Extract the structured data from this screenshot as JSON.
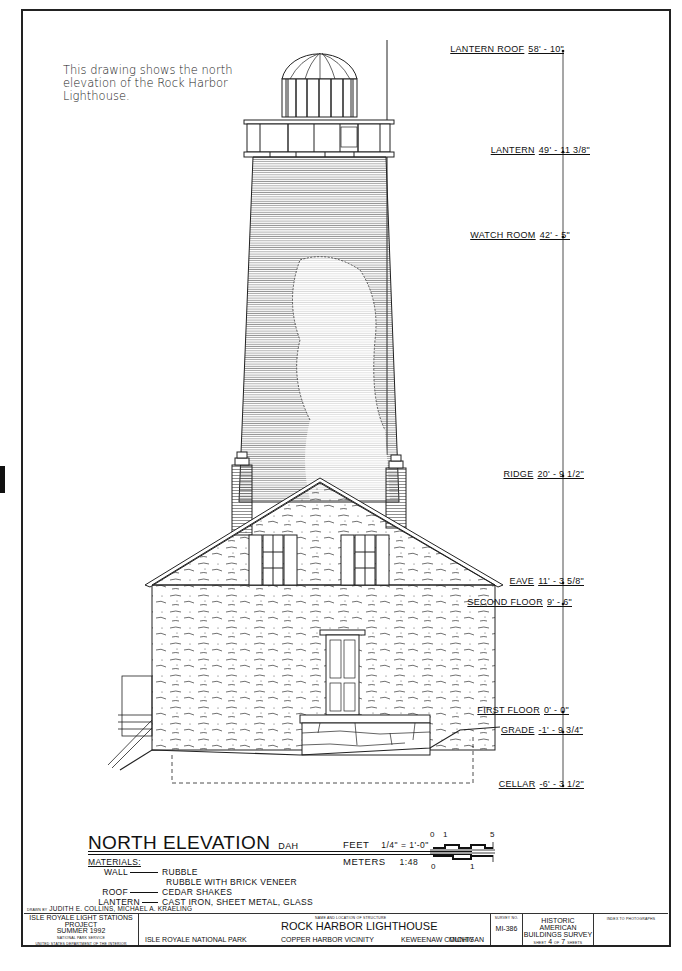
{
  "caption": "This drawing shows the north elevation of the Rock Harbor Lighthouse.",
  "elevations": [
    {
      "name": "LANTERN ROOF",
      "value": "58' - 10\""
    },
    {
      "name": "LANTERN",
      "value": "49' - 11 3/8\""
    },
    {
      "name": "WATCH ROOM",
      "value": "42' - 5\""
    },
    {
      "name": "RIDGE",
      "value": "20' - 9 1/2\""
    },
    {
      "name": "EAVE",
      "value": "11' - 3 5/8\""
    },
    {
      "name": "SECOND FLOOR",
      "value": "9' - 6\""
    },
    {
      "name": "FIRST FLOOR",
      "value": "0' - 0\""
    },
    {
      "name": "GRADE",
      "value": "-1' - 9 3/4\""
    },
    {
      "name": "CELLAR",
      "value": "-6' - 3 1/2\""
    }
  ],
  "title": {
    "main": "NORTH ELEVATION",
    "suffix": "DAH"
  },
  "scale": {
    "feet_label": "FEET",
    "feet_value": "1/4\" = 1'-0\"",
    "meters_label": "METERS",
    "meters_value": "1:48",
    "feet_ticks": [
      "0",
      "1",
      "5"
    ],
    "meter_ticks": [
      "0",
      "1"
    ]
  },
  "materials": {
    "header": "MATERIALS:",
    "rows": [
      {
        "key": "WALL",
        "value": "RUBBLE"
      },
      {
        "key": "",
        "value": "RUBBLE WITH BRICK VENEER"
      },
      {
        "key": "ROOF",
        "value": "CEDAR SHAKES"
      },
      {
        "key": "LANTERN",
        "value": "CAST IRON, SHEET METAL, GLASS"
      }
    ]
  },
  "title_block": {
    "drawn_by_label": "DRAWN BY",
    "drawn_by": "JUDITH E. COLLINS, MICHAEL A. KRAELING",
    "project": "ISLE ROYALE LIGHT STATIONS PROJECT",
    "date": "SUMMER 1992",
    "agency": "NATIONAL PARK SERVICE",
    "department": "UNITED STATES DEPARTMENT OF THE INTERIOR",
    "park": "ISLE ROYALE NATIONAL PARK",
    "structure_label": "NAME AND LOCATION OF STRUCTURE",
    "structure_name": "ROCK HARBOR LIGHTHOUSE",
    "vicinity": "COPPER HARBOR VICINITY",
    "county": "KEWEENAW COUNTY",
    "state": "MICHIGAN",
    "survey_label": "SURVEY NO.",
    "survey_no": "MI-386",
    "habs_line1": "HISTORIC AMERICAN",
    "habs_line2": "BUILDINGS SURVEY",
    "sheet_label": "SHEET",
    "sheet_no": "4",
    "of_label": "OF",
    "sheet_total": "7",
    "sheets_label": "SHEETS",
    "index_label": "INDEX TO PHOTOGRAPHS"
  }
}
